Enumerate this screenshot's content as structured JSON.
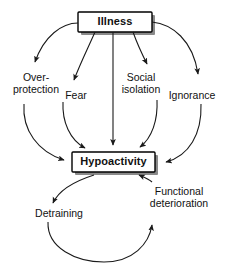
{
  "diagram": {
    "background_color": "#ffffff",
    "line_color": "#1a1a1a",
    "box_fill_color": "#ffffff",
    "box_border_color": "#000000",
    "box_shadow_color": "#8a8a8a",
    "nodes": {
      "illness": {
        "label": "Illness",
        "shape": "box",
        "style": "bold"
      },
      "hypoactivity": {
        "label": "Hypoactivity",
        "shape": "box",
        "style": "bold"
      },
      "overprotection": {
        "label": "Over-\nprotection",
        "shape": "plain"
      },
      "fear": {
        "label": "Fear",
        "shape": "plain"
      },
      "social_isolation": {
        "label": "Social\nisolation",
        "shape": "plain"
      },
      "ignorance": {
        "label": "Ignorance",
        "shape": "plain"
      },
      "detraining": {
        "label": "Detraining",
        "shape": "plain"
      },
      "functional_deterioration": {
        "label": "Functional\ndeterioration",
        "shape": "plain"
      }
    },
    "edges": [
      {
        "from": "illness",
        "to": "overprotection",
        "style": "curved-arrow"
      },
      {
        "from": "illness",
        "to": "fear",
        "style": "curved-arrow"
      },
      {
        "from": "illness",
        "to": "hypoactivity",
        "style": "straight-arrow"
      },
      {
        "from": "illness",
        "to": "social_isolation",
        "style": "curved-arrow"
      },
      {
        "from": "illness",
        "to": "ignorance",
        "style": "curved-arrow"
      },
      {
        "from": "overprotection",
        "to": "hypoactivity",
        "style": "curved-arrow"
      },
      {
        "from": "fear",
        "to": "hypoactivity",
        "style": "curved-arrow"
      },
      {
        "from": "social_isolation",
        "to": "hypoactivity",
        "style": "curved-arrow"
      },
      {
        "from": "ignorance",
        "to": "hypoactivity",
        "style": "curved-arrow"
      },
      {
        "from": "hypoactivity",
        "to": "detraining",
        "style": "curved-arrow"
      },
      {
        "from": "detraining",
        "to": "functional_deterioration",
        "style": "curved-arrow"
      },
      {
        "from": "functional_deterioration",
        "to": "hypoactivity",
        "style": "curved-arrow"
      }
    ]
  }
}
